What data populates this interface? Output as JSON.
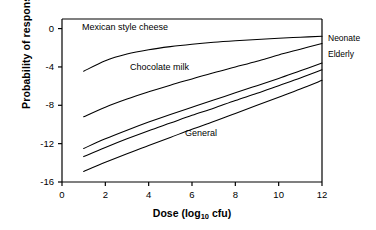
{
  "chart_data": {
    "type": "line",
    "title": "",
    "xlabel": "Dose (log10 cfu)",
    "xlabel_main": "Dose (log",
    "xlabel_sub": "10",
    "xlabel_tail": " cfu)",
    "ylabel": "Probability of response (log10)",
    "ylabel_main": "Probability of response (log",
    "ylabel_sub": "10",
    "ylabel_tail": ")",
    "xlim": [
      0,
      12
    ],
    "ylim": [
      -16,
      1
    ],
    "xticks": [
      "0",
      "2",
      "4",
      "6",
      "8",
      "10",
      "12"
    ],
    "xtick_values": [
      0,
      2,
      4,
      6,
      8,
      10,
      12
    ],
    "yticks": [
      "0",
      "-4",
      "-8",
      "-12",
      "-16"
    ],
    "ytick_values": [
      0,
      -4,
      -8,
      -12,
      -16
    ],
    "grid": false,
    "legend_position": "inline-annotations",
    "line_color": "#000000",
    "series": [
      {
        "name": "Mexican style cheese",
        "annotation": "Mexican style cheese",
        "x": [
          1,
          2,
          3,
          4,
          5,
          6,
          7,
          8,
          9,
          10,
          11,
          12
        ],
        "values": [
          -4.45,
          -3.35,
          -2.65,
          -2.2,
          -1.88,
          -1.63,
          -1.43,
          -1.27,
          -1.13,
          -1.0,
          -0.9,
          -0.8
        ]
      },
      {
        "name": "Chocolate milk",
        "annotation": "Chocolate milk",
        "x": [
          1,
          2,
          3,
          4,
          5,
          6,
          7,
          8,
          9,
          10,
          11,
          12
        ],
        "values": [
          -9.2,
          -8.2,
          -7.35,
          -6.6,
          -5.9,
          -5.25,
          -4.6,
          -4.0,
          -3.4,
          -2.75,
          -2.15,
          -1.55
        ]
      },
      {
        "name": "Neonate",
        "annotation": "Neonate",
        "x": [
          1,
          2,
          3,
          4,
          5,
          6,
          7,
          8,
          9,
          10,
          11,
          12
        ],
        "values": [
          -12.5,
          -11.5,
          -10.6,
          -9.75,
          -8.95,
          -8.2,
          -7.45,
          -6.7,
          -5.95,
          -5.2,
          -4.4,
          -3.6
        ]
      },
      {
        "name": "Elderly",
        "annotation": "Elderly",
        "x": [
          1,
          2,
          3,
          4,
          5,
          6,
          7,
          8,
          9,
          10,
          11,
          12
        ],
        "values": [
          -13.35,
          -12.4,
          -11.5,
          -10.65,
          -9.85,
          -9.05,
          -8.3,
          -7.5,
          -6.75,
          -5.95,
          -5.15,
          -4.3
        ]
      },
      {
        "name": "General",
        "annotation": "General",
        "x": [
          1,
          2,
          3,
          4,
          5,
          6,
          7,
          8,
          9,
          10,
          11,
          12
        ],
        "values": [
          -14.9,
          -13.95,
          -13.05,
          -12.2,
          -11.35,
          -10.5,
          -9.7,
          -8.85,
          -8.0,
          -7.15,
          -6.3,
          -5.4
        ]
      }
    ],
    "annotations": [
      {
        "text": "Mexican style cheese",
        "x_px": 82,
        "y_px": 22
      },
      {
        "text": "Chocolate milk",
        "x_px": 130,
        "y_px": 62
      },
      {
        "text": "General",
        "x_px": 185,
        "y_px": 128
      }
    ],
    "right_labels": [
      {
        "text": "Neonate",
        "y_px": 33
      },
      {
        "text": "Elderly",
        "y_px": 49
      }
    ]
  }
}
